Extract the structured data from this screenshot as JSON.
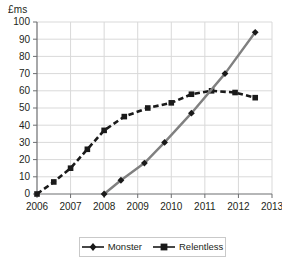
{
  "chart_data": {
    "type": "line",
    "title": "",
    "subtitle": "",
    "xlabel": "",
    "ylabel": "£ms",
    "xlim": [
      2006,
      2013
    ],
    "ylim": [
      0,
      100
    ],
    "ytick_step": 10,
    "grid": true,
    "legend_position": "bottom",
    "xticks": [
      "2006",
      "2007",
      "2008",
      "2009",
      "2010",
      "2011",
      "2012",
      "2013"
    ],
    "yticks": [
      "0",
      "10",
      "20",
      "30",
      "40",
      "50",
      "60",
      "70",
      "80",
      "90",
      "100"
    ],
    "series": [
      {
        "name": "Monster",
        "marker": "diamond",
        "line_style": "solid",
        "line_color": "#808080",
        "marker_color": "#1a1a1a",
        "x": [
          2008,
          2008.5,
          2009.2,
          2009.8,
          2010.6,
          2011.6,
          2012.5
        ],
        "values": [
          0,
          8,
          18,
          30,
          47,
          70,
          94
        ]
      },
      {
        "name": "Relentless",
        "marker": "square",
        "line_style": "dashed",
        "line_color": "#1a1a1a",
        "marker_color": "#1a1a1a",
        "x": [
          2006,
          2006.5,
          2007,
          2007.5,
          2008,
          2008.6,
          2009.3,
          2010,
          2010.6,
          2011.2,
          2011.9,
          2012.5
        ],
        "values": [
          0,
          7,
          15,
          26,
          37,
          45,
          50,
          53,
          58,
          60,
          59,
          56
        ]
      }
    ]
  },
  "legend": {
    "entries": [
      {
        "label": "Monster"
      },
      {
        "label": "Relentless"
      }
    ]
  },
  "colors": {
    "axis": "#6d6e71",
    "grid": "#d9d9d9",
    "text": "#231f20",
    "monster_line": "#808080",
    "relentless_line": "#1a1a1a",
    "legend_border": "#c9c9c9"
  }
}
